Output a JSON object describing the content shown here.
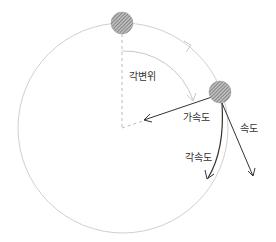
{
  "diagram": {
    "labels": {
      "angular_displacement": "각변위",
      "acceleration": "가속도",
      "velocity": "속도",
      "angular_acceleration": "각속도"
    },
    "colors": {
      "orbit": "#d0d0d0",
      "arrow": "#333333",
      "ball": "#888888",
      "dashed": "#bbbbbb"
    }
  }
}
